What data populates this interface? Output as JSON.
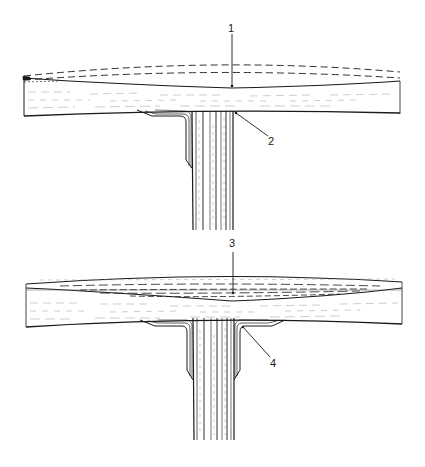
{
  "diagram": {
    "type": "technical-illustration",
    "panels": [
      {
        "id": "top",
        "description": "T-joint with upper flange plate showing original (dashed) and deformed surface",
        "callouts": [
          {
            "number": "1",
            "target": "thinned-flange-surface"
          },
          {
            "number": "2",
            "target": "stem-flange-junction"
          }
        ]
      },
      {
        "id": "bottom",
        "description": "T-joint with layered filler in flange and fillets on both sides of stem",
        "callouts": [
          {
            "number": "3",
            "target": "layered-filler-region"
          },
          {
            "number": "4",
            "target": "fillet-at-junction"
          }
        ]
      }
    ],
    "labels": {
      "one": "1",
      "two": "2",
      "three": "3",
      "four": "4"
    },
    "colors": {
      "ink": "#1a1a1a",
      "hatch": "#9a9a9a",
      "background": "#ffffff"
    }
  }
}
